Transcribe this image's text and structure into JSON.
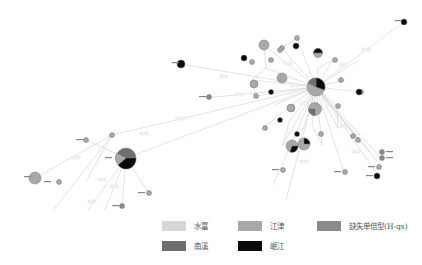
{
  "diagram": {
    "type": "haplotype-network",
    "legend": [
      {
        "label": "水富",
        "color": "#d6d6d6",
        "x": 162,
        "y": 222
      },
      {
        "label": "江津",
        "color": "#a8a8a8",
        "x": 238,
        "y": 222
      },
      {
        "label": "缺失单倍型(H-qs)",
        "color": "#8a8a8a",
        "x": 317,
        "y": 222
      },
      {
        "label": "南溪",
        "color": "#6e6e6e",
        "x": 162,
        "y": 241
      },
      {
        "label": "岷江",
        "color": "#0a0a0a",
        "x": 238,
        "y": 241
      }
    ],
    "edge_color": "#c8c8c8",
    "node_stroke": "#777777",
    "hubs": [
      {
        "name": "main-cluster-hub",
        "x": 316,
        "y": 87,
        "r": 9,
        "slices": [
          "#a8a8a8",
          "#0a0a0a",
          "#6e6e6e"
        ]
      },
      {
        "name": "secondary-hub",
        "x": 126,
        "y": 158,
        "r": 10,
        "slices": [
          "#6e6e6e",
          "#0a0a0a",
          "#a8a8a8"
        ]
      }
    ]
  }
}
